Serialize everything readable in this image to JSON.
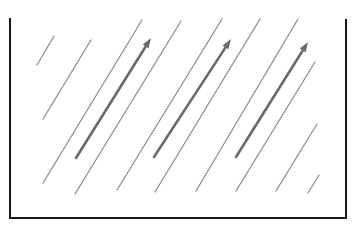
{
  "diagram": {
    "title": "",
    "colors": {
      "frame": "#1a1a1a",
      "line": "#8a8a8a",
      "arrow": "#6a6a6a"
    },
    "thin_line_count": 10,
    "arrow_count": 3
  }
}
